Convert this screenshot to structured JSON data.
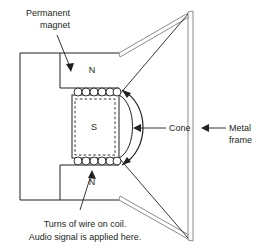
{
  "diagram": {
    "colors": {
      "ink": "#231f20",
      "frame_gray": "#9a9a9c",
      "background": "#ffffff"
    },
    "poles": {
      "north_top": "N",
      "north_bottom": "N",
      "south_center": "S"
    },
    "labels": {
      "permanent_magnet_line1": "Permanent",
      "permanent_magnet_line2": "magnet",
      "cone": "Cone",
      "metal_frame_line1": "Metal",
      "metal_frame_line2": "frame",
      "caption_line1": "Turns of wire on coil.",
      "caption_line2": "Audio signal is applied here."
    },
    "coil": {
      "turns_top": 7,
      "turns_bottom": 7
    },
    "icons": {
      "arrow_permanent_magnet": "arrow-down-right-icon",
      "arrow_cone": "arrow-left-icon",
      "arrow_metal_frame": "arrow-left-icon",
      "arrow_coil": "arrow-up-right-icon",
      "motion_arc": "double-headed-arc-arrow-icon"
    }
  }
}
